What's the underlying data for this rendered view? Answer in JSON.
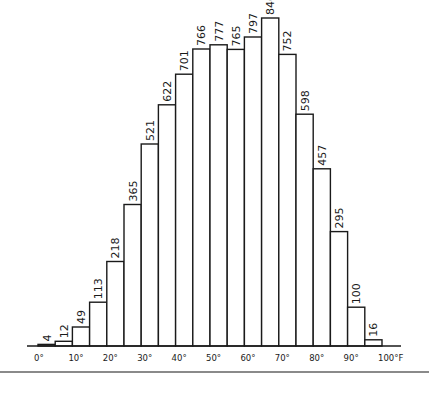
{
  "chart_data": {
    "type": "bar",
    "title": "",
    "xlabel": "Temperature (°F)",
    "ylabel": "",
    "bin_width": 5,
    "bin_starts": [
      0,
      5,
      10,
      15,
      20,
      25,
      30,
      35,
      40,
      45,
      50,
      55,
      60,
      65,
      70,
      75,
      80,
      85,
      90,
      95
    ],
    "categories": [
      "0-5",
      "5-10",
      "10-15",
      "15-20",
      "20-25",
      "25-30",
      "30-35",
      "35-40",
      "40-45",
      "45-50",
      "50-55",
      "55-60",
      "60-65",
      "65-70",
      "70-75",
      "75-80",
      "80-85",
      "85-90",
      "90-95",
      "95-100"
    ],
    "values": [
      4,
      12,
      49,
      113,
      218,
      365,
      521,
      622,
      701,
      766,
      777,
      765,
      797,
      846,
      752,
      598,
      457,
      295,
      100,
      16
    ],
    "x_tick_labels": [
      "0°",
      "10°",
      "20°",
      "30°",
      "40°",
      "50°",
      "60°",
      "70°",
      "80°",
      "90°",
      "100°F"
    ],
    "x_ticks": [
      0,
      10,
      20,
      30,
      40,
      50,
      60,
      70,
      80,
      90,
      100
    ],
    "xlim": [
      0,
      100
    ],
    "ylim": [
      0,
      846
    ],
    "grid": false,
    "legend": null,
    "value_labels_rotated": true
  }
}
